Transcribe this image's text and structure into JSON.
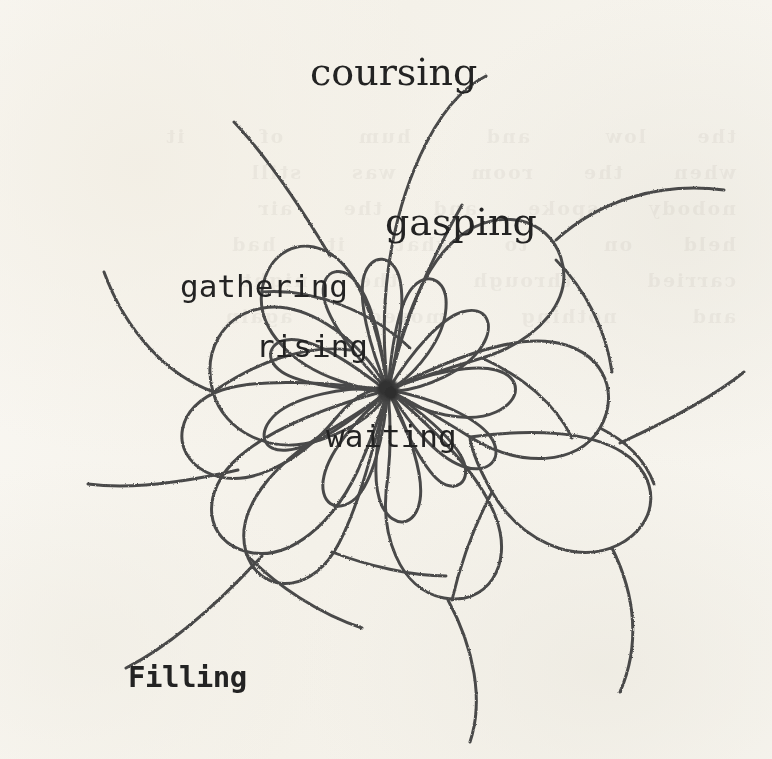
{
  "artwork": {
    "title": "Filling",
    "medium": "pen-on-paper spirograph rose curve",
    "background_color": "#fbfaf7",
    "ink_color": "#4a4a4a",
    "text_color": "#232323",
    "center": {
      "x": 388,
      "y": 390
    },
    "hub": {
      "radius": 11,
      "color": "#3a3a3a"
    }
  },
  "labels": [
    {
      "id": "coursing",
      "text": "coursing",
      "x": 310,
      "y": 50,
      "font": "serif",
      "size": 38,
      "weight": "normal",
      "rotate": 0
    },
    {
      "id": "gasping",
      "text": "gasping",
      "x": 385,
      "y": 200,
      "font": "serif",
      "size": 38,
      "weight": "normal",
      "rotate": 0
    },
    {
      "id": "gathering",
      "text": "gathering",
      "x": 180,
      "y": 268,
      "font": "mono",
      "size": 31,
      "weight": "normal",
      "rotate": 0
    },
    {
      "id": "rising",
      "text": "rising",
      "x": 256,
      "y": 328,
      "font": "mono",
      "size": 31,
      "weight": "normal",
      "rotate": 0
    },
    {
      "id": "waiting",
      "text": "waiting",
      "x": 326,
      "y": 418,
      "font": "mono",
      "size": 31,
      "weight": "normal",
      "rotate": 0
    },
    {
      "id": "filling",
      "text": "Filling",
      "x": 128,
      "y": 660,
      "font": "mono",
      "size": 29,
      "weight": "bold",
      "rotate": 0
    }
  ],
  "ghost": {
    "lines": "the  low   and   hum   of   it\nwhen  the  room   was  still\nnobody  spoke  and  the  air\nheld  on   to  what  it  had\ncarried   through   the  night\nand   nothing   moved   again"
  },
  "curve": {
    "type": "rhodonea-rose",
    "inner_petals": 11,
    "outer_petals": 11,
    "tails": 9,
    "inner_radius": 92,
    "outer_radius": 205,
    "stroke_width": 3.1,
    "description": "Eleven small teardrop petals and eleven larger looping petals radiate from a dense central hub; long curving tails sweep outward past the petals toward the page edges."
  }
}
